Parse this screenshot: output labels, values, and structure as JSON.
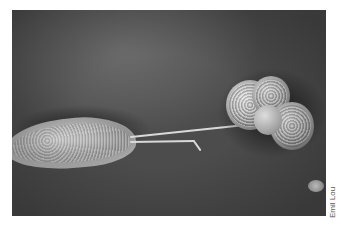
{
  "figure": {
    "background_color": "#ffffff",
    "credit": "Emil Lou"
  }
}
